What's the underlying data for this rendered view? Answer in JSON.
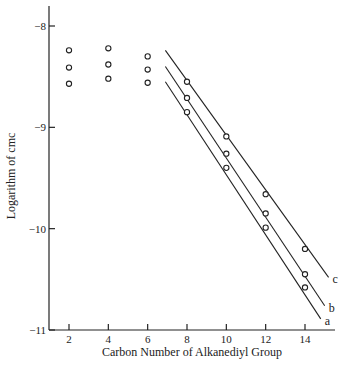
{
  "chart_data": {
    "type": "scatter",
    "title": "",
    "xlabel": "Carbon Number of Alkanediyl Group",
    "ylabel": "Logarithm of cmc",
    "xlim": [
      1,
      15.5
    ],
    "ylim": [
      -11,
      -7.75
    ],
    "xticks": [
      2,
      4,
      6,
      8,
      10,
      12,
      14
    ],
    "yticks": [
      -8,
      -9,
      -10,
      -11
    ],
    "xtick_labels": [
      "2",
      "4",
      "6",
      "8",
      "10",
      "12",
      "14"
    ],
    "ytick_labels": [
      "-8",
      "-9",
      "-10",
      "-11"
    ],
    "grid": false,
    "legend": "inline line-end labels",
    "scatter_short_chain": [
      {
        "x": 2,
        "values": [
          -8.24,
          -8.41,
          -8.57
        ]
      },
      {
        "x": 4,
        "values": [
          -8.22,
          -8.38,
          -8.52
        ]
      },
      {
        "x": 6,
        "values": [
          -8.3,
          -8.43,
          -8.56
        ]
      }
    ],
    "series": [
      {
        "name": "c",
        "x": [
          8,
          10,
          12,
          14
        ],
        "values": [
          -8.55,
          -9.09,
          -9.66,
          -10.2
        ],
        "fit_line": {
          "x": [
            6.9,
            15.2
          ],
          "y": [
            -8.24,
            -10.48
          ]
        }
      },
      {
        "name": "b",
        "x": [
          8,
          10,
          12,
          14
        ],
        "values": [
          -8.71,
          -9.26,
          -9.85,
          -10.45
        ],
        "fit_line": {
          "x": [
            6.9,
            15.0
          ],
          "y": [
            -8.4,
            -10.76
          ]
        }
      },
      {
        "name": "a",
        "x": [
          8,
          10,
          12,
          14
        ],
        "values": [
          -8.85,
          -9.4,
          -9.99,
          -10.58
        ],
        "fit_line": {
          "x": [
            6.9,
            14.8
          ],
          "y": [
            -8.55,
            -10.89
          ]
        }
      }
    ]
  }
}
